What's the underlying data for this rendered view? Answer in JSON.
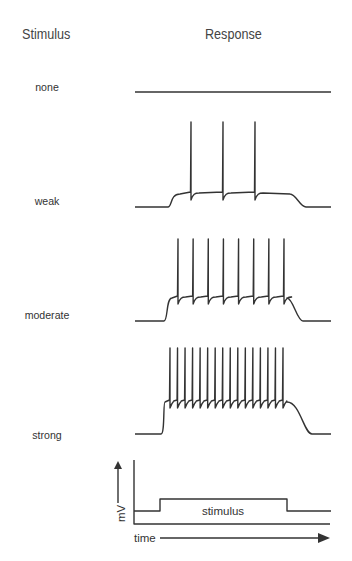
{
  "headers": {
    "stimulus": "Stimulus",
    "response": "Response"
  },
  "rows": [
    {
      "label": "none",
      "spikes": 0
    },
    {
      "label": "weak",
      "spikes": 3
    },
    {
      "label": "moderate",
      "spikes": 8
    },
    {
      "label": "strong",
      "spikes": 16
    }
  ],
  "legend": {
    "stimulus_label": "stimulus",
    "y_axis_label": "mV",
    "x_axis_label": "time"
  },
  "colors": {
    "trace": "#333333",
    "text": "#333333"
  }
}
